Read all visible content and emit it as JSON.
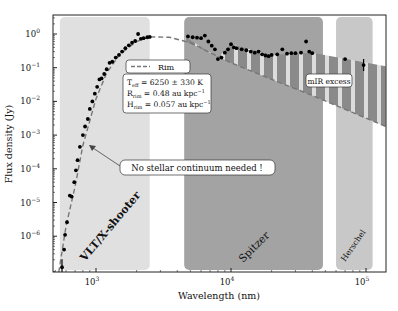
{
  "chart_data": {
    "type": "scatter",
    "title": "",
    "xlabel": "Wavelength (nm)",
    "ylabel": "Flux density (Jy)",
    "xscale": "log",
    "yscale": "log",
    "xlim": [
      480,
      141000
    ],
    "ylim": [
      8.5e-08,
      3.6
    ],
    "x_ticks": [
      {
        "v": 1000,
        "label": "10",
        "exp": "3"
      },
      {
        "v": 10000,
        "label": "10",
        "exp": "4"
      },
      {
        "v": 100000,
        "label": "10",
        "exp": "5"
      }
    ],
    "y_ticks": [
      {
        "v": 1,
        "label": "10",
        "exp": "0"
      },
      {
        "v": 0.1,
        "label": "10",
        "exp": "−1"
      },
      {
        "v": 0.01,
        "label": "10",
        "exp": "−2"
      },
      {
        "v": 0.001,
        "label": "10",
        "exp": "−3"
      },
      {
        "v": 0.0001,
        "label": "10",
        "exp": "−4"
      },
      {
        "v": 1e-05,
        "label": "10",
        "exp": "−5"
      },
      {
        "v": 1e-06,
        "label": "10",
        "exp": "−6"
      }
    ],
    "bands": [
      {
        "name": "VLT/X-shooter",
        "x0": 540,
        "x1": 2500,
        "color": "#e0e0e0"
      },
      {
        "name": "Spitzer",
        "x0": 4500,
        "x1": 48000,
        "color": "#a3a3a3"
      },
      {
        "name": "Herschel",
        "x0": 60000,
        "x1": 112000,
        "color": "#c8c8c8"
      }
    ],
    "series": [
      {
        "name": "Observed photometry/spectrum",
        "style": "points",
        "points": [
          [
            560,
            1.2e-07
          ],
          [
            580,
            4e-07
          ],
          [
            590,
            1.1e-06
          ],
          [
            610,
            2.6e-06
          ],
          [
            640,
            1.6e-05
          ],
          [
            660,
            1.5e-05
          ],
          [
            690,
            4e-05
          ],
          [
            710,
            9e-05
          ],
          [
            730,
            0.00018
          ],
          [
            760,
            0.00045
          ],
          [
            800,
            0.001
          ],
          [
            830,
            0.0018
          ],
          [
            870,
            0.003
          ],
          [
            900,
            0.006
          ],
          [
            940,
            0.01
          ],
          [
            980,
            0.017
          ],
          [
            1020,
            0.027
          ],
          [
            1060,
            0.045
          ],
          [
            1100,
            0.048
          ],
          [
            1150,
            0.065
          ],
          [
            1200,
            0.09
          ],
          [
            1260,
            0.14
          ],
          [
            1320,
            0.15
          ],
          [
            1400,
            0.2
          ],
          [
            1480,
            0.24
          ],
          [
            1560,
            0.3
          ],
          [
            1650,
            0.38
          ],
          [
            1750,
            0.46
          ],
          [
            1850,
            0.55
          ],
          [
            1950,
            0.62
          ],
          [
            2050,
            1.0
          ],
          [
            2150,
            0.72
          ],
          [
            2250,
            0.75
          ],
          [
            2400,
            0.8
          ],
          [
            2500,
            0.82
          ],
          [
            4800,
            0.85
          ],
          [
            5200,
            0.8
          ],
          [
            5600,
            0.78
          ],
          [
            6000,
            0.75
          ],
          [
            6400,
            0.9
          ],
          [
            6800,
            0.6
          ],
          [
            7200,
            0.45
          ],
          [
            7600,
            0.35
          ],
          [
            8000,
            0.18
          ],
          [
            8500,
            0.2
          ],
          [
            9000,
            0.28
          ],
          [
            9500,
            0.35
          ],
          [
            10000,
            0.5
          ],
          [
            10500,
            0.4
          ],
          [
            11000,
            0.38
          ],
          [
            12000,
            0.35
          ],
          [
            13000,
            0.33
          ],
          [
            14000,
            0.3
          ],
          [
            15000,
            0.28
          ],
          [
            16000,
            0.3
          ],
          [
            17000,
            0.25
          ],
          [
            18000,
            0.23
          ],
          [
            19000,
            0.22
          ],
          [
            20000,
            0.24
          ],
          [
            22000,
            0.25
          ],
          [
            24000,
            0.35
          ],
          [
            26000,
            0.26
          ],
          [
            28000,
            0.27
          ],
          [
            30000,
            0.27
          ],
          [
            33000,
            0.28
          ],
          [
            36000,
            0.6
          ],
          [
            38000,
            0.3
          ],
          [
            40000,
            0.27
          ],
          [
            70000,
            0.18
          ],
          [
            96000,
            0.12
          ]
        ]
      },
      {
        "name": "Rim",
        "style": "dashed",
        "points": [
          [
            530,
            8.5e-08
          ],
          [
            600,
            2e-06
          ],
          [
            700,
            3e-05
          ],
          [
            800,
            0.0005
          ],
          [
            1000,
            0.012
          ],
          [
            1200,
            0.07
          ],
          [
            1500,
            0.25
          ],
          [
            2000,
            0.6
          ],
          [
            2500,
            0.82
          ],
          [
            3500,
            0.8
          ],
          [
            5000,
            0.55
          ],
          [
            7000,
            0.28
          ],
          [
            10000,
            0.14
          ],
          [
            20000,
            0.045
          ],
          [
            40000,
            0.015
          ],
          [
            140000,
            0.0018
          ]
        ]
      }
    ],
    "shaded_region": {
      "name": "mIR excess",
      "pattern": "vertical hatch",
      "color": "#8a8a8a",
      "upper": [
        [
          4600,
          0.82
        ],
        [
          8000,
          0.2
        ],
        [
          10000,
          0.5
        ],
        [
          20000,
          0.24
        ],
        [
          40000,
          0.28
        ],
        [
          140000,
          0.11
        ]
      ],
      "lower": [
        [
          4600,
          0.6
        ],
        [
          10000,
          0.14
        ],
        [
          20000,
          0.045
        ],
        [
          40000,
          0.015
        ],
        [
          140000,
          0.0018
        ]
      ]
    },
    "annotations": [
      {
        "text": "No stellar continuum needed !",
        "target_x": 810,
        "target_y": 0.0008
      },
      {
        "text": "mIR excess"
      }
    ],
    "legend": {
      "entries": [
        {
          "label": "Rim",
          "style": "dashed"
        }
      ],
      "params": [
        {
          "sym": "T",
          "sub": "eff",
          "rest": " = 6250 ± 330 K"
        },
        {
          "sym": "R",
          "sub": "rim",
          "rest": " = 0.48 au kpc",
          "sup": "−1"
        },
        {
          "sym": "H",
          "sub": "rim",
          "rest": " = 0.057 au kpc",
          "sup": "−1"
        }
      ],
      "position": "upper-center"
    },
    "grid": false
  },
  "labels": {
    "xlabel": "Wavelength (nm)",
    "ylabel": "Flux density (Jy)",
    "band_vlt": "VLT/X-shooter",
    "band_spitzer": "Spitzer",
    "band_herschel": "Herschel",
    "legend_rim": "Rim",
    "annotation_continuum": "No stellar continuum needed !",
    "annotation_mir": "mIR excess"
  }
}
